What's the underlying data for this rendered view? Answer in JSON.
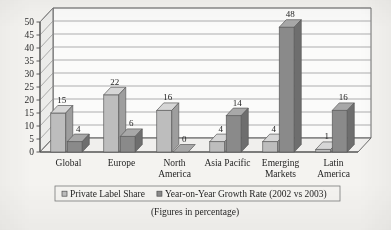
{
  "chart_data": {
    "type": "bar",
    "title": "",
    "subtitle": "",
    "caption": "(Figures in percentage)",
    "xlabel": "",
    "ylabel": "",
    "ylim": [
      0,
      50
    ],
    "ytick_step": 5,
    "yticks": [
      "0",
      "5",
      "10",
      "15",
      "20",
      "25",
      "30",
      "35",
      "40",
      "45",
      "50"
    ],
    "grid": true,
    "three_d": true,
    "legend_position": "bottom",
    "categories": [
      "Global",
      "Europe",
      "North America",
      "Asia Pacific",
      "Emerging Markets",
      "Latin America"
    ],
    "category_lines": [
      [
        "Global"
      ],
      [
        "Europe"
      ],
      [
        "North",
        "America"
      ],
      [
        "Asia Pacific"
      ],
      [
        "Emerging",
        "Markets"
      ],
      [
        "Latin",
        "America"
      ]
    ],
    "series": [
      {
        "name": "Private Label Share",
        "color": "#bdbdbd",
        "values": [
          15,
          22,
          16,
          4,
          4,
          1
        ],
        "labels": [
          "15",
          "22",
          "16",
          "4",
          "4",
          "1"
        ]
      },
      {
        "name": "Year-on-Year Growth Rate (2002 vs 2003)",
        "color": "#8a8a8a",
        "values": [
          4,
          6,
          0,
          14,
          48,
          16
        ],
        "labels": [
          "4",
          "6",
          "0",
          "14",
          "48",
          "16"
        ]
      }
    ]
  },
  "legend": {
    "items": [
      {
        "label": "Private Label Share",
        "swatch": "light-swatch-icon"
      },
      {
        "label": "Year-on-Year Growth Rate (2002 vs 2003)",
        "swatch": "dark-swatch-icon"
      }
    ]
  },
  "colors": {
    "series_light": "#bdbdbd",
    "series_light_top": "#d6d6d6",
    "series_light_side": "#9e9e9e",
    "series_dark": "#8a8a8a",
    "series_dark_top": "#a8a8a8",
    "series_dark_side": "#6e6e6e",
    "plot_background": "#fbfbfa",
    "wall_side": "#ececea",
    "floor": "#f0efed",
    "gridline": "#8d8d8d",
    "axis": "#4a4a4a",
    "page_background": "#f4f3f0",
    "text": "#1f1f1f"
  }
}
